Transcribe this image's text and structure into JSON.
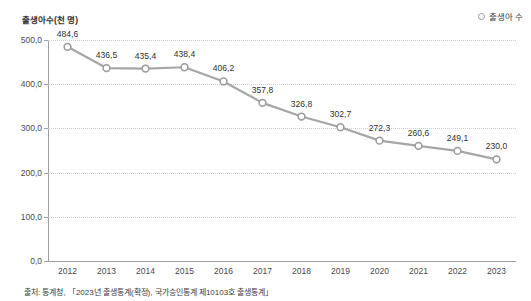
{
  "chart_data": {
    "type": "line",
    "title": "",
    "ylabel": "출생아수(천 명)",
    "xlabel": "",
    "categories": [
      "2012",
      "2013",
      "2014",
      "2015",
      "2016",
      "2017",
      "2018",
      "2019",
      "2020",
      "2021",
      "2022",
      "2023"
    ],
    "values": [
      484.6,
      436.5,
      435.4,
      438.4,
      406.2,
      357.8,
      326.8,
      302.7,
      272.3,
      260.6,
      249.1,
      230.0
    ],
    "point_labels": [
      "484,6",
      "436,5",
      "435,4",
      "438,4",
      "406,2",
      "357,8",
      "326,8",
      "302,7",
      "272,3",
      "260,6",
      "249,1",
      "230,0"
    ],
    "series": [
      {
        "name": "출생아 수",
        "values": [
          484.6,
          436.5,
          435.4,
          438.4,
          406.2,
          357.8,
          326.8,
          302.7,
          272.3,
          260.6,
          249.1,
          230.0
        ]
      }
    ],
    "ylim": [
      0,
      500
    ],
    "y_ticks": [
      0,
      100,
      200,
      300,
      400,
      500
    ],
    "y_tick_labels": [
      "0,0",
      "100,0",
      "200,0",
      "300,0",
      "400,0",
      "500,0"
    ],
    "grid": true,
    "legend_position": "top-right",
    "colors": {
      "line": "#a6a6a6",
      "marker_fill": "#ffffff",
      "marker_stroke": "#9a9a9a",
      "grid": "#cfcfcf",
      "axis": "#9e9e9e",
      "text": "#3b3b3b"
    }
  },
  "legend": {
    "items": [
      {
        "label": "출생아 수",
        "marker": "circle-outline-marker"
      }
    ]
  },
  "source": {
    "note": "출처: 통계청, 「2023년 출생통계(확정), 국가승인통계 제10103호 출생통계」"
  }
}
